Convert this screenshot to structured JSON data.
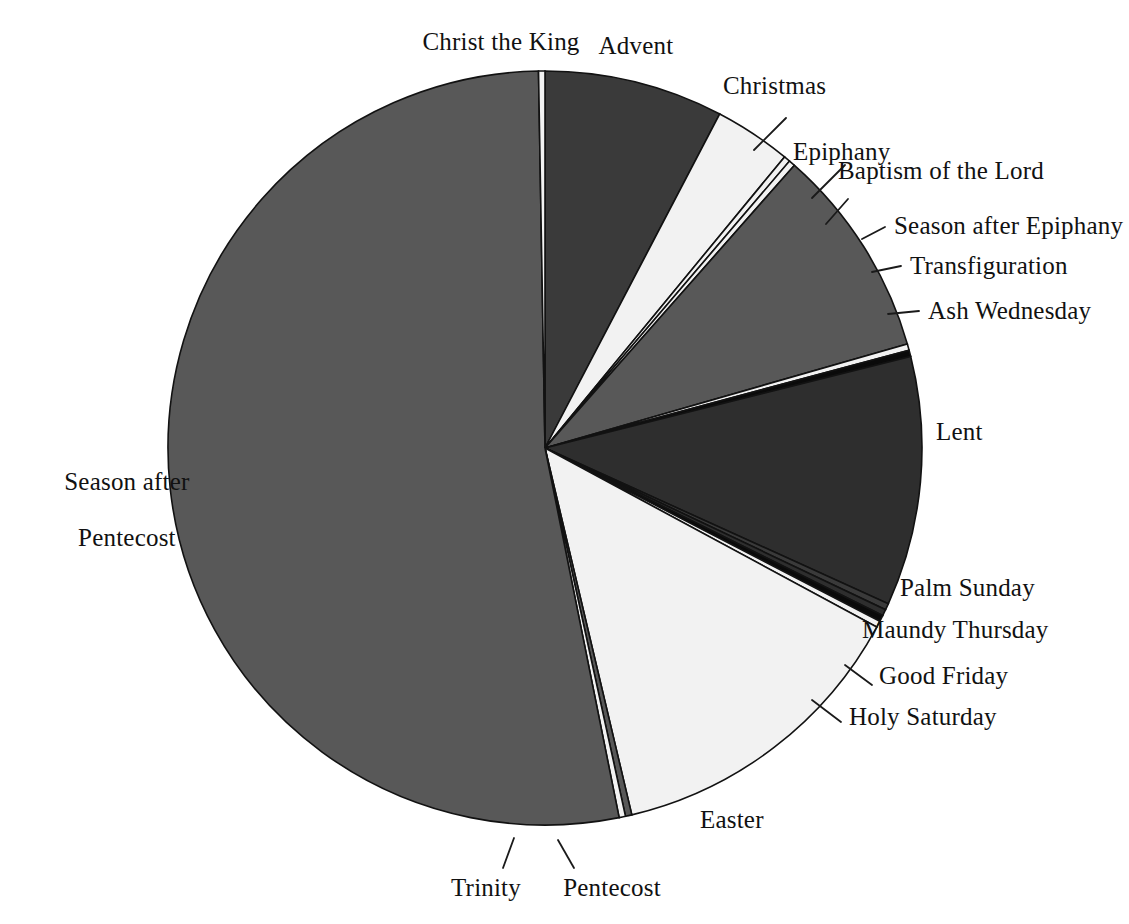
{
  "chart_data": {
    "type": "pie",
    "title": "",
    "subtitle": "",
    "xlabel": "",
    "ylabel": "",
    "legend_position": "none",
    "grid": false,
    "units": "days of the liturgical year",
    "total_days": 365,
    "start_angle_deg": 0,
    "direction": "clockwise",
    "categories": [
      "Advent",
      "Christmas",
      "Epiphany",
      "Baptism of the Lord",
      "Season after Epiphany",
      "Transfiguration",
      "Ash Wednesday",
      "Lent",
      "Palm Sunday",
      "Maundy Thursday",
      "Good Friday",
      "Holy Saturday",
      "Easter",
      "Pentecost",
      "Trinity",
      "Season after Pentecost",
      "Christ the King"
    ],
    "values": [
      28,
      12,
      1,
      1,
      33,
      1,
      1,
      39,
      1,
      1,
      1,
      1,
      49,
      1,
      1,
      193,
      1
    ],
    "colors": [
      "#3a3a3a",
      "#f2f2f2",
      "#f2f2f2",
      "#f2f2f2",
      "#585858",
      "#f2f2f2",
      "#0a0a0a",
      "#2e2e2e",
      "#3a3a3a",
      "#2e2e2e",
      "#0a0a0a",
      "#f2f2f2",
      "#f2f2f2",
      "#585858",
      "#f2f2f2",
      "#585858",
      "#f2f2f2"
    ]
  },
  "labels": {
    "advent": "Advent",
    "christmas": "Christmas",
    "epiphany": "Epiphany",
    "baptism_of_the_lord": "Baptism of the Lord",
    "season_after_epiphany": "Season after Epiphany",
    "transfiguration": "Transfiguration",
    "ash_wednesday": "Ash Wednesday",
    "lent": "Lent",
    "palm_sunday": "Palm Sunday",
    "maundy_thursday": "Maundy Thursday",
    "good_friday": "Good Friday",
    "holy_saturday": "Holy Saturday",
    "easter": "Easter",
    "pentecost": "Pentecost",
    "trinity": "Trinity",
    "season_after_pentecost_line1": "Season after",
    "season_after_pentecost_line2": "Pentecost",
    "christ_the_king": "Christ the King"
  }
}
